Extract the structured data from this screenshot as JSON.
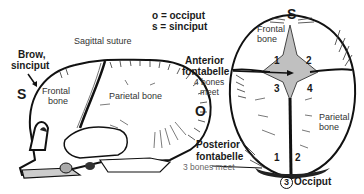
{
  "legend": {
    "o_line": "o = occiput",
    "s_line": "s = sinciput"
  },
  "lateral_view": {
    "sagittal_suture": "Sagittal suture",
    "brow_line1": "Brow,",
    "brow_line2": "sinciput",
    "s_marker": "S",
    "o_marker": "O",
    "frontal_line1": "Frontal",
    "frontal_line2": "bone",
    "parietal": "Parietal bone"
  },
  "fontanelles": {
    "anterior_line1": "Anterior",
    "anterior_line2": "fontabelle",
    "anterior_note1": "4 bones",
    "anterior_note2": "meet",
    "posterior_line1": "Posterior",
    "posterior_line2": "fontabelle",
    "posterior_note": "3 bones meet"
  },
  "top_view": {
    "s_marker": "S",
    "frontal_line1": "Frontal",
    "frontal_line2": "bone",
    "bone_numbers": [
      "1",
      "2",
      "3",
      "4"
    ],
    "parietal_line1": "Parietal",
    "parietal_line2": "bone",
    "posterior_numbers": [
      "1",
      "2"
    ],
    "occiput_number": "3",
    "occiput_label": "Occiput"
  },
  "colors": {
    "ink": "#1a1a1a",
    "background": "#ffffff",
    "fontanelle_fill": "#bdbdbd"
  }
}
